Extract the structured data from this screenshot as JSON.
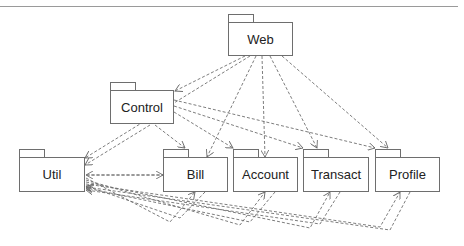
{
  "diagram": {
    "type": "uml-package-dependency",
    "packages": [
      {
        "id": "web",
        "label": "Web",
        "x": 228,
        "y": 14,
        "w": 65,
        "h": 34
      },
      {
        "id": "control",
        "label": "Control",
        "x": 110,
        "y": 82,
        "w": 64,
        "h": 34
      },
      {
        "id": "util",
        "label": "Util",
        "x": 19,
        "y": 149,
        "w": 65,
        "h": 35
      },
      {
        "id": "bill",
        "label": "Bill",
        "x": 163,
        "y": 149,
        "w": 65,
        "h": 35
      },
      {
        "id": "account",
        "label": "Account",
        "x": 233,
        "y": 149,
        "w": 65,
        "h": 35
      },
      {
        "id": "transact",
        "label": "Transact",
        "x": 303,
        "y": 149,
        "w": 66,
        "h": 35
      },
      {
        "id": "profile",
        "label": "Profile",
        "x": 375,
        "y": 149,
        "w": 65,
        "h": 35
      }
    ],
    "dependencies": [
      {
        "from": "web",
        "to": "control"
      },
      {
        "from": "web",
        "to": "util"
      },
      {
        "from": "web",
        "to": "bill"
      },
      {
        "from": "web",
        "to": "account"
      },
      {
        "from": "web",
        "to": "transact"
      },
      {
        "from": "web",
        "to": "profile"
      },
      {
        "from": "control",
        "to": "util"
      },
      {
        "from": "control",
        "to": "bill"
      },
      {
        "from": "control",
        "to": "account"
      },
      {
        "from": "control",
        "to": "transact"
      },
      {
        "from": "control",
        "to": "profile"
      },
      {
        "from": "util",
        "to": "bill"
      },
      {
        "from": "bill",
        "to": "util"
      },
      {
        "from": "account",
        "to": "util"
      },
      {
        "from": "util",
        "to": "account"
      },
      {
        "from": "transact",
        "to": "util"
      },
      {
        "from": "util",
        "to": "transact"
      },
      {
        "from": "profile",
        "to": "util"
      },
      {
        "from": "util",
        "to": "profile"
      }
    ],
    "line_color": "#6e6e6e"
  }
}
